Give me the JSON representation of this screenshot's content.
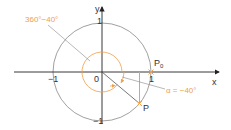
{
  "diagram": {
    "axes": {
      "x_label": "x",
      "y_label": "y",
      "origin_label": "0",
      "x_tick_pos": "1",
      "x_tick_neg": "−1",
      "y_tick_pos": "1",
      "y_tick_neg": "−1"
    },
    "points": {
      "p0_label": "P",
      "p0_subscript": "0",
      "p_label": "P"
    },
    "annotations": {
      "large_angle": "360°−40°",
      "small_angle": "α = −40°"
    },
    "colors": {
      "accent": "#f0a04b",
      "axis": "#222222",
      "circle": "#888888"
    }
  }
}
